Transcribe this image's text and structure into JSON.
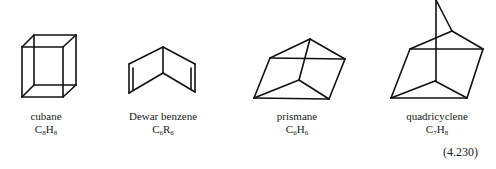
{
  "figure": {
    "equation_number": "(4.230)",
    "line_color": "#111111",
    "molecules": [
      {
        "name": "cubane",
        "formula": {
          "e1": "C",
          "n1": "8",
          "e2": "H",
          "n2": "8"
        },
        "edges": [
          [
            22,
            47,
            63,
            47
          ],
          [
            63,
            47,
            63,
            97
          ],
          [
            63,
            97,
            22,
            97
          ],
          [
            22,
            97,
            22,
            47
          ],
          [
            34,
            35,
            76,
            35
          ],
          [
            76,
            35,
            76,
            85
          ],
          [
            76,
            85,
            34,
            85
          ],
          [
            34,
            85,
            34,
            35
          ],
          [
            22,
            47,
            34,
            35
          ],
          [
            63,
            47,
            76,
            35
          ],
          [
            63,
            97,
            76,
            85
          ],
          [
            22,
            97,
            34,
            85
          ]
        ]
      },
      {
        "name": "Dewar benzene",
        "formula": {
          "e1": "C",
          "n1": "6",
          "e2": "R",
          "n2": "6"
        },
        "edges": [
          [
            163,
            47,
            163,
            73
          ],
          [
            163,
            47,
            129,
            64
          ],
          [
            129,
            64,
            129,
            93
          ],
          [
            129,
            93,
            163,
            73
          ],
          [
            163,
            47,
            195,
            64
          ],
          [
            195,
            64,
            195,
            92
          ],
          [
            195,
            92,
            163,
            73
          ],
          [
            133,
            68,
            133,
            90
          ],
          [
            191,
            68,
            191,
            89
          ]
        ]
      },
      {
        "name": "prismane",
        "formula": {
          "e1": "C",
          "n1": "6",
          "e2": "H",
          "n2": "6"
        },
        "edges": [
          [
            310,
            39,
            270,
            58
          ],
          [
            310,
            39,
            345,
            59
          ],
          [
            270,
            58,
            345,
            59
          ],
          [
            310,
            39,
            299,
            80
          ],
          [
            270,
            58,
            254,
            98
          ],
          [
            345,
            59,
            329,
            99
          ],
          [
            299,
            80,
            254,
            98
          ],
          [
            299,
            80,
            329,
            99
          ],
          [
            254,
            98,
            329,
            99
          ]
        ]
      },
      {
        "name": "quadricyclene",
        "formula": {
          "e1": "C",
          "n1": "7",
          "e2": "H",
          "n2": "8"
        },
        "edges": [
          [
            436,
            0,
            436,
            81
          ],
          [
            436,
            0,
            452,
            31
          ],
          [
            452,
            31,
            410,
            49
          ],
          [
            452,
            31,
            483,
            49
          ],
          [
            410,
            49,
            483,
            49
          ],
          [
            410,
            49,
            391,
            98
          ],
          [
            483,
            49,
            467,
            98
          ],
          [
            435,
            81,
            391,
            98
          ],
          [
            435,
            81,
            467,
            98
          ],
          [
            391,
            98,
            467,
            98
          ]
        ]
      }
    ]
  }
}
